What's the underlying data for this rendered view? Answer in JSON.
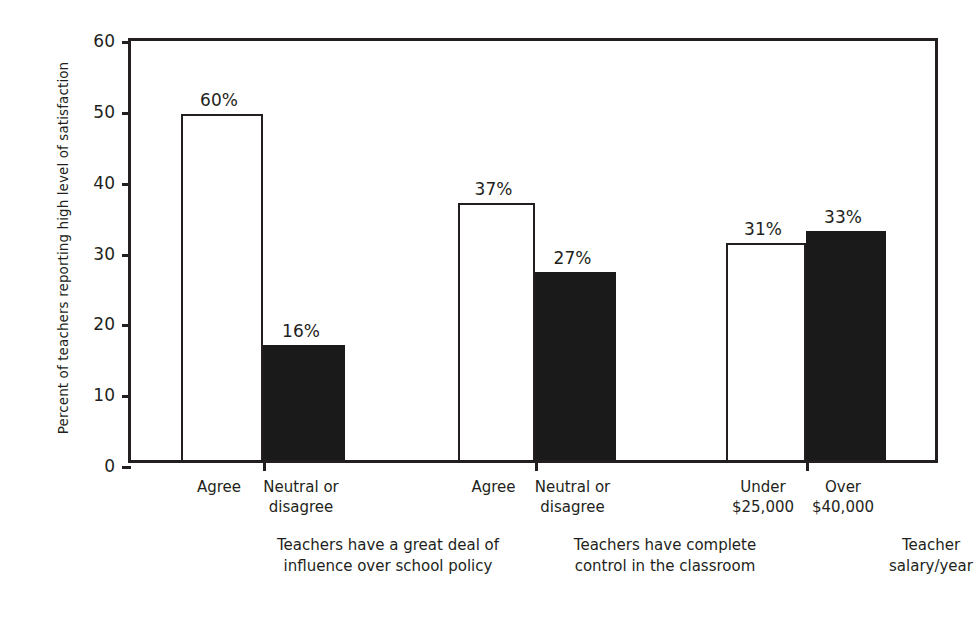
{
  "chart_data": {
    "type": "bar",
    "title": "",
    "subtitle": "",
    "xlabel": "",
    "ylabel": "Percent of teachers reporting high level of satisfaction",
    "ylim": [
      0,
      60
    ],
    "ytick_labels": [
      "0",
      "10",
      "20",
      "30",
      "40",
      "50",
      "60"
    ],
    "ytick_values": [
      0,
      10,
      20,
      30,
      40,
      50,
      60
    ],
    "grid": false,
    "legend": "none",
    "categories": [
      "Agree",
      "Neutral or\ndisagree",
      "Agree",
      "Neutral or\ndisagree",
      "Under\n$25,000",
      "Over\n$40,000"
    ],
    "values": [
      48.8,
      16.2,
      36.3,
      26.5,
      30.6,
      32.4
    ],
    "data_labels": [
      "60%",
      "16%",
      "37%",
      "27%",
      "31%",
      "33%"
    ],
    "bar_styles": [
      "open",
      "solid",
      "open",
      "solid",
      "open",
      "solid"
    ],
    "groups": [
      "Teachers have a great deal of\ninfluence over school policy",
      "Teachers have complete\ncontrol in the classroom",
      "Teacher salary/year"
    ],
    "colors": {
      "open_bar_fill": "#ffffff",
      "open_bar_stroke": "#231f20",
      "solid_bar_fill": "#1a1a1a",
      "axis": "#231f20",
      "text": "#231f20",
      "background": "#ffffff"
    }
  },
  "bars": [
    {
      "label": "60%",
      "category": "Agree",
      "value": 48.8,
      "style": "open",
      "left": 50,
      "width": 82
    },
    {
      "label": "16%",
      "category": "Neutral or\ndisagree",
      "value": 16.2,
      "style": "solid",
      "left": 132,
      "width": 82
    },
    {
      "label": "37%",
      "category": "Agree",
      "value": 36.3,
      "style": "open",
      "left": 327,
      "width": 77
    },
    {
      "label": "27%",
      "category": "Neutral or\ndisagree",
      "value": 26.5,
      "style": "solid",
      "left": 404,
      "width": 81
    },
    {
      "label": "31%",
      "category": "Under\n$25,000",
      "value": 30.6,
      "style": "open",
      "left": 595,
      "width": 80
    },
    {
      "label": "33%",
      "category": "Over\n$40,000",
      "value": 32.4,
      "style": "solid",
      "left": 675,
      "width": 80
    }
  ],
  "group_labels": [
    {
      "text": "Teachers have a great deal of\ninfluence over school policy",
      "center": 260
    },
    {
      "text": "Teachers have complete\ncontrol in the classroom",
      "center": 537
    },
    {
      "text": "Teacher salary/year",
      "center": 803
    }
  ]
}
